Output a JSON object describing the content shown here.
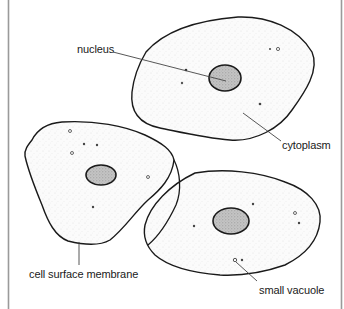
{
  "diagram": {
    "title": "",
    "colors": {
      "outline": "#1a1a1a",
      "leader": "#444444",
      "frame": "#9a9a9a",
      "nucleus_fill": "#bdbdbd",
      "cytoplasm_fill": "#f7f7f7"
    },
    "labels": {
      "nucleus": "nucleus",
      "cytoplasm": "cytoplasm",
      "cell_surface_membrane": "cell surface membrane",
      "small_vacuole": "small vacuole"
    },
    "cells": [
      {
        "name": "top-cell",
        "nucleus": {
          "cx": 225,
          "cy": 78,
          "rx": 16,
          "ry": 13
        }
      },
      {
        "name": "left-cell",
        "nucleus": {
          "cx": 101,
          "cy": 175,
          "rx": 15,
          "ry": 10
        }
      },
      {
        "name": "bottom-right-cell",
        "nucleus": {
          "cx": 231,
          "cy": 221,
          "rx": 18,
          "ry": 13
        }
      }
    ]
  }
}
